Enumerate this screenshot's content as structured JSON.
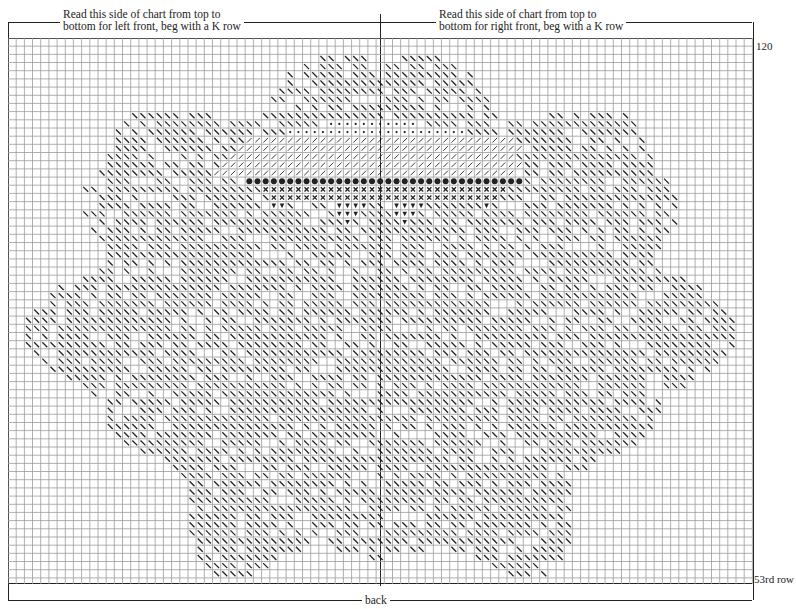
{
  "chart": {
    "top_left_note": {
      "line1": "Read this side of chart from top to",
      "line2": "bottom for left front, beg with a K row"
    },
    "top_right_note": {
      "line1": "Read this side of chart from top to",
      "line2": "bottom for right front, beg with a K row"
    },
    "row_label_top": "120",
    "row_label_bottom": "53rd row",
    "bottom_label": "back",
    "grid": {
      "columns": 91,
      "rows": 67,
      "cell_px": 8.18,
      "center_column": 45
    },
    "colors": {
      "grid_line": "#9a9a9a",
      "symbol": "#222222",
      "frame": "#222222"
    },
    "symbols": {
      "backslash": "diagonal stitch (\\)",
      "slash": "diagonal stitch (/)",
      "dot": "small dot",
      "bullet": "filled circle",
      "cross": "x",
      "triangle": "filled down triangle"
    }
  }
}
